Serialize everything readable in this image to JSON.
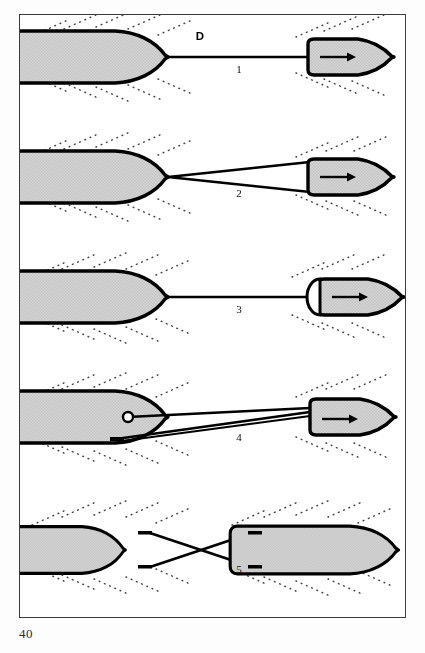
{
  "page": {
    "page_number": "40",
    "background_color": "#ffffff"
  },
  "figure": {
    "frame_color": "#3c3c3c",
    "hull_fill": "#d2d2d2",
    "hull_stroke": "#000000",
    "wake_color": "#444444",
    "direction_label": "D",
    "panels": [
      {
        "number": "1",
        "name": "single-towline-centre-lead",
        "label": "1",
        "towed_vessel": "large-vessel",
        "tug": "small-tug",
        "line_type": "single",
        "tug_arrow": "right"
      },
      {
        "number": "2",
        "name": "bridle-towline",
        "label": "2",
        "towed_vessel": "large-vessel",
        "tug": "small-tug",
        "line_type": "bridle",
        "tug_arrow": "right"
      },
      {
        "number": "3",
        "name": "single-towline-bow-fender",
        "label": "3",
        "towed_vessel": "large-vessel",
        "tug": "small-tug-with-stern-fender",
        "line_type": "single",
        "tug_arrow": "right"
      },
      {
        "number": "4",
        "name": "bollard-and-spring-line",
        "label": "4",
        "towed_vessel": "large-vessel-with-bollard",
        "tug": "small-tug",
        "line_type": "double-with-bollard",
        "tug_arrow": "right"
      },
      {
        "number": "5",
        "name": "crossed-lines-two-vessels",
        "label": "5",
        "towed_vessel": "large-vessel",
        "tug": "large-vessel",
        "line_type": "crossed",
        "tug_arrow": "none"
      }
    ]
  }
}
